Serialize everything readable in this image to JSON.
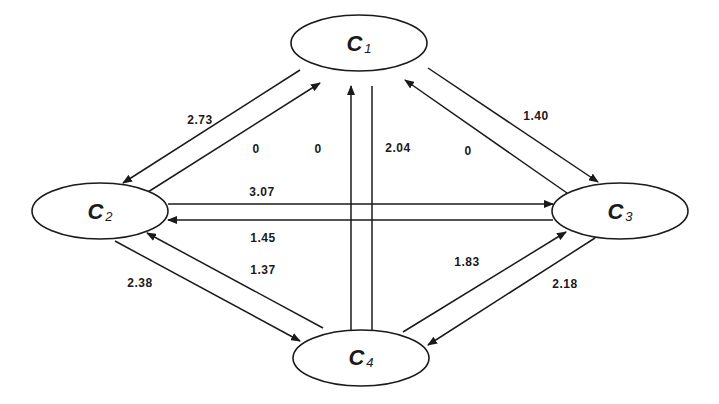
{
  "diagram": {
    "type": "directed-graph",
    "nodes": [
      {
        "id": "C1",
        "letter": "C",
        "subscript": "1",
        "cx": 359,
        "cy": 43,
        "rx": 68,
        "ry": 28
      },
      {
        "id": "C2",
        "letter": "C",
        "subscript": "2",
        "cx": 100,
        "cy": 211,
        "rx": 68,
        "ry": 28
      },
      {
        "id": "C3",
        "letter": "C",
        "subscript": "3",
        "cx": 620,
        "cy": 211,
        "rx": 68,
        "ry": 28
      },
      {
        "id": "C4",
        "letter": "C",
        "subscript": "4",
        "cx": 361,
        "cy": 358,
        "rx": 68,
        "ry": 28
      }
    ],
    "edges": [
      {
        "from": "C1",
        "to": "C2",
        "weight": "2.73",
        "x1": 300,
        "y1": 70,
        "x2": 123,
        "y2": 183,
        "lx": 200,
        "ly": 120
      },
      {
        "from": "C2",
        "to": "C1",
        "weight": "0",
        "x1": 148,
        "y1": 192,
        "x2": 320,
        "y2": 83,
        "lx": 256,
        "ly": 149
      },
      {
        "from": "C4",
        "to": "C1",
        "weight": "0",
        "x1": 351,
        "y1": 331,
        "x2": 351,
        "y2": 86,
        "lx": 318,
        "ly": 149
      },
      {
        "from": "C1",
        "to": "C4",
        "weight": "2.04",
        "x1": 372,
        "y1": 86,
        "x2": 372,
        "y2": 345,
        "lx": 398,
        "ly": 148
      },
      {
        "from": "C3",
        "to": "C1",
        "weight": "0",
        "x1": 567,
        "y1": 193,
        "x2": 405,
        "y2": 80,
        "lx": 468,
        "ly": 151
      },
      {
        "from": "C1",
        "to": "C3",
        "weight": "1.40",
        "x1": 428,
        "y1": 68,
        "x2": 598,
        "y2": 182,
        "lx": 536,
        "ly": 116
      },
      {
        "from": "C2",
        "to": "C3",
        "weight": "3.07",
        "x1": 168,
        "y1": 204,
        "x2": 553,
        "y2": 204,
        "lx": 262,
        "ly": 192
      },
      {
        "from": "C3",
        "to": "C2",
        "weight": "1.45",
        "x1": 553,
        "y1": 220,
        "x2": 168,
        "y2": 220,
        "lx": 263,
        "ly": 238
      },
      {
        "from": "C4",
        "to": "C2",
        "weight": "1.37",
        "x1": 323,
        "y1": 328,
        "x2": 147,
        "y2": 233,
        "lx": 263,
        "ly": 270
      },
      {
        "from": "C2",
        "to": "C4",
        "weight": "2.38",
        "x1": 115,
        "y1": 241,
        "x2": 300,
        "y2": 341,
        "lx": 140,
        "ly": 283
      },
      {
        "from": "C4",
        "to": "C3",
        "weight": "1.83",
        "x1": 403,
        "y1": 332,
        "x2": 566,
        "y2": 232,
        "lx": 467,
        "ly": 262
      },
      {
        "from": "C3",
        "to": "C4",
        "weight": "2.18",
        "x1": 595,
        "y1": 238,
        "x2": 428,
        "y2": 345,
        "lx": 565,
        "ly": 284
      }
    ]
  },
  "labels": {
    "node_C1": {
      "letter": "C",
      "sub": "1"
    },
    "node_C2": {
      "letter": "C",
      "sub": "2"
    },
    "node_C3": {
      "letter": "C",
      "sub": "3"
    },
    "node_C4": {
      "letter": "C",
      "sub": "4"
    },
    "edge_C1_C2": "2.73",
    "edge_C2_C1": "0",
    "edge_C4_C1": "0",
    "edge_C1_C4": "2.04",
    "edge_C3_C1": "0",
    "edge_C1_C3": "1.40",
    "edge_C2_C3": "3.07",
    "edge_C3_C2": "1.45",
    "edge_C4_C2": "1.37",
    "edge_C2_C4": "2.38",
    "edge_C4_C3": "1.83",
    "edge_C3_C4": "2.18"
  },
  "colors": {
    "stroke": "#1a1a1a",
    "background": "#ffffff"
  }
}
